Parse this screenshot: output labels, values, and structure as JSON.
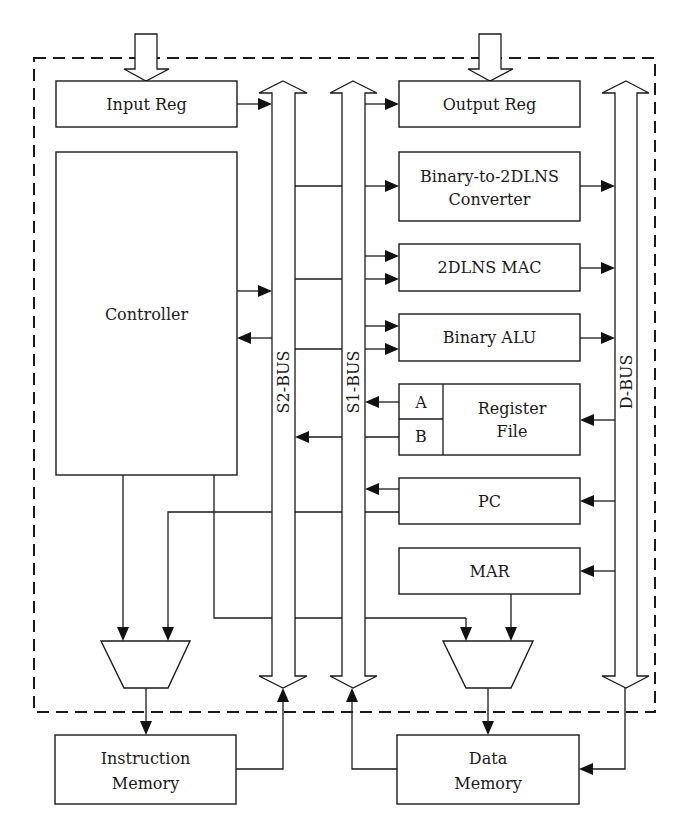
{
  "diagram": {
    "blocks": {
      "input_reg": "Input Reg",
      "output_reg": "Output Reg",
      "controller": "Controller",
      "converter_line1": "Binary-to-2DLNS",
      "converter_line2": "Converter",
      "mac": "2DLNS MAC",
      "alu": "Binary ALU",
      "regfile_line1": "Register",
      "regfile_line2": "File",
      "regfile_port_a": "A",
      "regfile_port_b": "B",
      "pc": "PC",
      "mar": "MAR",
      "imem_line1": "Instruction",
      "imem_line2": "Memory",
      "dmem_line1": "Data",
      "dmem_line2": "Memory"
    },
    "buses": {
      "s2": "S2-BUS",
      "s1": "S1-BUS",
      "d": "D-BUS"
    },
    "colors": {
      "stroke": "#1a1a1a",
      "background": "#ffffff"
    }
  }
}
